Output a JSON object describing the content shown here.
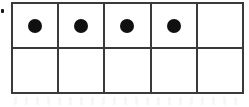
{
  "figure": {
    "kind": "ten-frame",
    "rows": 2,
    "columns": 5,
    "total_cells": 10,
    "filled_count": 4,
    "empty_count": 6,
    "counter_shape": "filled-circle",
    "colors": {
      "background": "#ffffff",
      "grid_line": "#3a3a3a",
      "counter_fill": "#101010",
      "speck": "#171717"
    }
  },
  "grid": {
    "rows": [
      {
        "row_name": "top-row",
        "cells": [
          {
            "index": 1,
            "filled": true,
            "dot_label": "counter"
          },
          {
            "index": 2,
            "filled": true,
            "dot_label": "counter"
          },
          {
            "index": 3,
            "filled": true,
            "dot_label": "counter"
          },
          {
            "index": 4,
            "filled": true,
            "dot_label": "counter"
          },
          {
            "index": 5,
            "filled": false,
            "dot_label": ""
          }
        ]
      },
      {
        "row_name": "bottom-row",
        "cells": [
          {
            "index": 6,
            "filled": false,
            "dot_label": ""
          },
          {
            "index": 7,
            "filled": false,
            "dot_label": ""
          },
          {
            "index": 8,
            "filled": false,
            "dot_label": ""
          },
          {
            "index": 9,
            "filled": false,
            "dot_label": ""
          },
          {
            "index": 10,
            "filled": false,
            "dot_label": ""
          }
        ]
      }
    ]
  },
  "artifacts": {
    "edge_speck": {
      "present": true,
      "name": "stray-ink-speck"
    },
    "scan_noise": {
      "present": true,
      "name": "scan-noise-band"
    }
  }
}
